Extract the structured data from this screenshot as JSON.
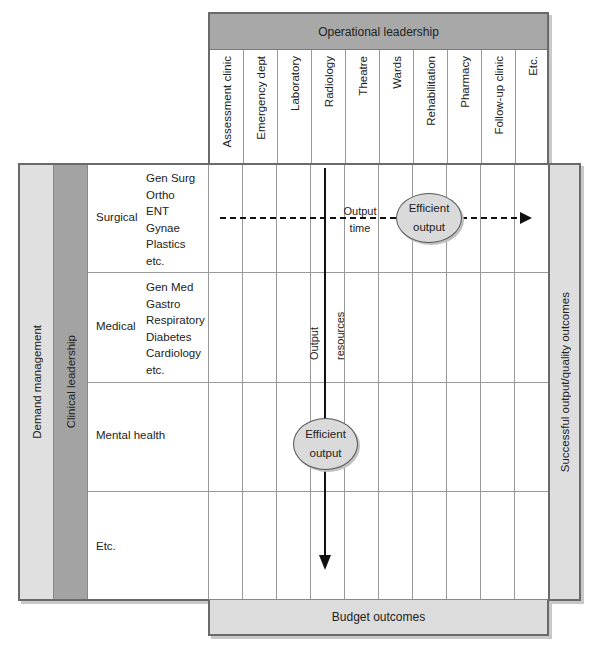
{
  "header": {
    "title": "Operational leadership",
    "columns": [
      "Assessment clinic",
      "Emergency dept",
      "Laboratory",
      "Radiology",
      "Theatre",
      "Wards",
      "Rehabilitation",
      "Pharmacy",
      "Follow-up clinic",
      "Etc."
    ]
  },
  "left": {
    "demand_label": "Demand management",
    "clinical_label": "Clinical leadership",
    "rows": [
      {
        "label": "Surgical",
        "items": [
          "Gen Surg",
          "Ortho",
          "ENT",
          "Gynae",
          "Plastics",
          "etc."
        ]
      },
      {
        "label": "Medical",
        "items": [
          "Gen Med",
          "Gastro",
          "Respiratory",
          "Diabetes",
          "Cardiology",
          "etc."
        ]
      },
      {
        "label": "Mental health",
        "items": []
      },
      {
        "label": "Etc.",
        "items": []
      }
    ]
  },
  "right": {
    "label": "Successful output/quality outcomes"
  },
  "bottom": {
    "label": "Budget outcomes"
  },
  "flows": {
    "horizontal": {
      "label_line1": "Output",
      "label_line2": "time"
    },
    "vertical": {
      "label_line1": "Output",
      "label_line2": "resources"
    },
    "ellipse_top": {
      "line1": "Efficient",
      "line2": "output"
    },
    "ellipse_bottom": {
      "line1": "Efficient",
      "line2": "output"
    }
  },
  "colors": {
    "header_fill": "#a8a8a8",
    "clinical_fill": "#a3a3a3",
    "demand_fill": "#e0e0e0",
    "outcome_fill": "#dedede",
    "border": "#6a6a6a"
  }
}
